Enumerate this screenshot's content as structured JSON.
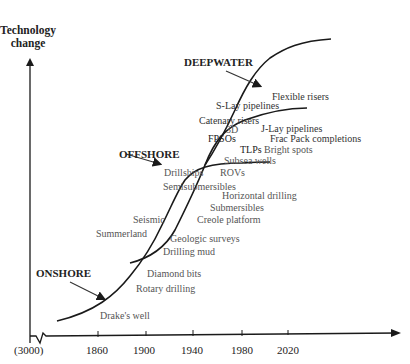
{
  "y_axis": {
    "title_line1": "Technology",
    "title_line2": "change"
  },
  "x_axis": {
    "ticks": [
      "(3000)",
      "1860",
      "1900",
      "1940",
      "1980",
      "2020"
    ]
  },
  "eras": {
    "onshore": "ONSHORE",
    "offshore": "OFFSHORE",
    "deepwater": "DEEPWATER"
  },
  "technologies": {
    "drakes_well": "Drake's well",
    "rotary_drilling": "Rotary drilling",
    "diamond_bits": "Diamond bits",
    "drilling_mud": "Drilling mud",
    "geologic_surveys": "Geologic surveys",
    "summerland": "Summerland",
    "seismic": "Seismic",
    "creole_platform": "Creole platform",
    "submersibles": "Submersibles",
    "horizontal_drilling": "Horizontal drilling",
    "semisubmersibles": "Semisubmersibles",
    "drillships": "Drillships",
    "rovs": "ROVs",
    "subsea_wells": "Subsea wells",
    "tlps": "TLPs",
    "fpsos": "FPSOs",
    "three_d": "3D",
    "catenary_risers": "Catenary risers",
    "s_lay_pipelines": "S-Lay pipelines",
    "flexible_risers": "Flexible risers",
    "j_lay_pipelines": "J-Lay pipelines",
    "frac_pack": "Frac Pack completions",
    "bright_spots": "Bright spots"
  },
  "colors": {
    "curve": "#1a1a1a",
    "label": "#555555",
    "era_label": "#222222"
  }
}
